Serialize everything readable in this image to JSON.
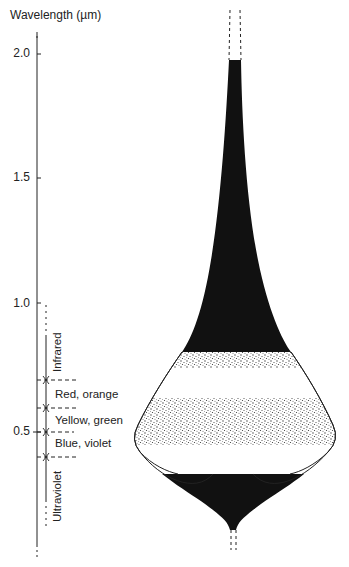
{
  "axis": {
    "title": "Wavelength (µm)",
    "ticks": [
      {
        "value": 2.0,
        "label": "2.0"
      },
      {
        "value": 1.5,
        "label": "1.5"
      },
      {
        "value": 1.0,
        "label": "1.0"
      },
      {
        "value": 0.5,
        "label": "0.5"
      }
    ]
  },
  "regions": [
    {
      "name": "Infrared",
      "range": [
        0.7,
        1.0
      ],
      "orientation": "vertical"
    },
    {
      "name": "Red, orange",
      "range": [
        0.6,
        0.7
      ],
      "orientation": "horizontal"
    },
    {
      "name": "Yellow, green",
      "range": [
        0.5,
        0.6
      ],
      "orientation": "horizontal"
    },
    {
      "name": "Blue, violet",
      "range": [
        0.4,
        0.5
      ],
      "orientation": "horizontal"
    },
    {
      "name": "Ultraviolet",
      "range": [
        0.2,
        0.4
      ],
      "orientation": "vertical"
    }
  ],
  "colors": {
    "ink": "#111111",
    "stipple": "#555555",
    "background": "#ffffff"
  }
}
